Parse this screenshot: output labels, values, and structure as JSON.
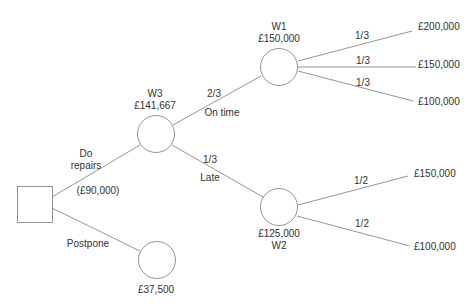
{
  "diagram": {
    "type": "decision-tree",
    "decision_node": {
      "shape": "square"
    },
    "decisions": {
      "do_repairs": {
        "label_line1": "Do",
        "label_line2": "repairs",
        "cost": "(£90,000)"
      },
      "postpone": {
        "label": "Postpone",
        "value": "£37,500"
      }
    },
    "w3": {
      "name": "W3",
      "value": "£141,667"
    },
    "on_time": {
      "probability": "2/3",
      "label": "On time"
    },
    "late": {
      "probability": "1/3",
      "label": "Late"
    },
    "w1": {
      "name": "W1",
      "value": "£150,000",
      "outcomes": [
        {
          "probability": "1/3",
          "value": "£200,000"
        },
        {
          "probability": "1/3",
          "value": "£150,000"
        },
        {
          "probability": "1/3",
          "value": "£100,000"
        }
      ]
    },
    "w2": {
      "name": "W2",
      "value": "£125,000",
      "outcomes": [
        {
          "probability": "1/2",
          "value": "£150,000"
        },
        {
          "probability": "1/2",
          "value": "£100,000"
        }
      ]
    },
    "colors": {
      "line": "#8a8a8a",
      "text": "#333333",
      "background": "#ffffff"
    }
  }
}
